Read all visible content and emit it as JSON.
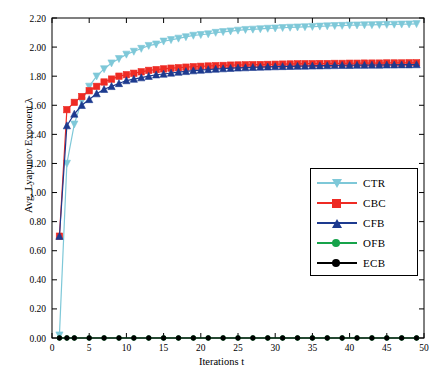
{
  "chart_data": {
    "type": "line",
    "title": "",
    "xlabel": "Iterations  t",
    "ylabel": "Avg. Lyapunov Exponent  λ",
    "xlim": [
      0,
      50
    ],
    "ylim": [
      0.0,
      2.2
    ],
    "xticks": [
      0,
      5,
      10,
      15,
      20,
      25,
      30,
      35,
      40,
      45,
      50
    ],
    "yticks": [
      "0.00",
      "0.20",
      "0.40",
      "0.60",
      "0.80",
      "1.00",
      "1.20",
      "1.40",
      "1.60",
      "1.80",
      "2.00",
      "2.20"
    ],
    "grid": false,
    "legend_position": "center-right",
    "x": [
      1,
      2,
      3,
      4,
      5,
      6,
      7,
      8,
      9,
      10,
      11,
      12,
      13,
      14,
      15,
      16,
      17,
      18,
      19,
      20,
      21,
      22,
      23,
      24,
      25,
      26,
      27,
      28,
      29,
      30,
      31,
      32,
      33,
      34,
      35,
      36,
      37,
      38,
      39,
      40,
      41,
      42,
      43,
      44,
      45,
      46,
      47,
      48,
      49
    ],
    "series": [
      {
        "name": "CTR",
        "color": "#7ec8d8",
        "marker": "triangle-down",
        "values": [
          0.02,
          1.2,
          1.47,
          1.63,
          1.73,
          1.8,
          1.85,
          1.89,
          1.92,
          1.95,
          1.97,
          1.99,
          2.01,
          2.02,
          2.04,
          2.05,
          2.06,
          2.07,
          2.08,
          2.085,
          2.09,
          2.1,
          2.105,
          2.11,
          2.115,
          2.12,
          2.122,
          2.125,
          2.128,
          2.13,
          2.133,
          2.135,
          2.137,
          2.139,
          2.141,
          2.143,
          2.145,
          2.147,
          2.148,
          2.15,
          2.151,
          2.152,
          2.153,
          2.154,
          2.155,
          2.156,
          2.157,
          2.158,
          2.16
        ]
      },
      {
        "name": "CBC",
        "color": "#ee2b24",
        "marker": "square",
        "values": [
          0.7,
          1.57,
          1.62,
          1.66,
          1.7,
          1.73,
          1.76,
          1.78,
          1.8,
          1.81,
          1.82,
          1.83,
          1.84,
          1.845,
          1.85,
          1.855,
          1.858,
          1.862,
          1.865,
          1.868,
          1.87,
          1.872,
          1.874,
          1.876,
          1.877,
          1.878,
          1.879,
          1.88,
          1.881,
          1.882,
          1.883,
          1.884,
          1.885,
          1.886,
          1.886,
          1.887,
          1.887,
          1.888,
          1.888,
          1.889,
          1.889,
          1.89,
          1.89,
          1.89,
          1.891,
          1.891,
          1.891,
          1.892,
          1.892
        ]
      },
      {
        "name": "CFB",
        "color": "#1d3a8f",
        "marker": "triangle-up",
        "values": [
          0.7,
          1.46,
          1.54,
          1.6,
          1.64,
          1.68,
          1.71,
          1.73,
          1.75,
          1.77,
          1.78,
          1.79,
          1.8,
          1.81,
          1.815,
          1.822,
          1.828,
          1.833,
          1.838,
          1.842,
          1.846,
          1.849,
          1.852,
          1.855,
          1.857,
          1.859,
          1.861,
          1.863,
          1.864,
          1.866,
          1.867,
          1.868,
          1.869,
          1.87,
          1.871,
          1.872,
          1.873,
          1.874,
          1.875,
          1.875,
          1.876,
          1.876,
          1.877,
          1.877,
          1.878,
          1.878,
          1.879,
          1.879,
          1.88
        ]
      },
      {
        "name": "OFB",
        "color": "#16a34a",
        "marker": "circle",
        "values": [
          0.0,
          0.0,
          0.0,
          0.0,
          0.0,
          0.0,
          0.0,
          0.0,
          0.0,
          0.0,
          0.0,
          0.0,
          0.0,
          0.0,
          0.0,
          0.0,
          0.0,
          0.0,
          0.0,
          0.0,
          0.0,
          0.0,
          0.0,
          0.0,
          0.0,
          0.0,
          0.0,
          0.0,
          0.0,
          0.0,
          0.0,
          0.0,
          0.0,
          0.0,
          0.0,
          0.0,
          0.0,
          0.0,
          0.0,
          0.0,
          0.0,
          0.0,
          0.0,
          0.0,
          0.0,
          0.0,
          0.0,
          0.0,
          0.0
        ]
      },
      {
        "name": "ECB",
        "color": "#000000",
        "marker": "circle",
        "values": [
          0.0,
          0.0,
          0.0,
          0.0,
          0.0,
          0.0,
          0.0,
          0.0,
          0.0,
          0.0,
          0.0,
          0.0,
          0.0,
          0.0,
          0.0,
          0.0,
          0.0,
          0.0,
          0.0,
          0.0,
          0.0,
          0.0,
          0.0,
          0.0,
          0.0,
          0.0,
          0.0,
          0.0,
          0.0,
          0.0,
          0.0,
          0.0,
          0.0,
          0.0,
          0.0,
          0.0,
          0.0,
          0.0,
          0.0,
          0.0,
          0.0,
          0.0,
          0.0,
          0.0,
          0.0,
          0.0,
          0.0,
          0.0,
          0.0
        ]
      }
    ]
  },
  "legend": {
    "items": [
      {
        "label": "CTR"
      },
      {
        "label": "CBC"
      },
      {
        "label": "CFB"
      },
      {
        "label": "OFB"
      },
      {
        "label": "ECB"
      }
    ]
  }
}
